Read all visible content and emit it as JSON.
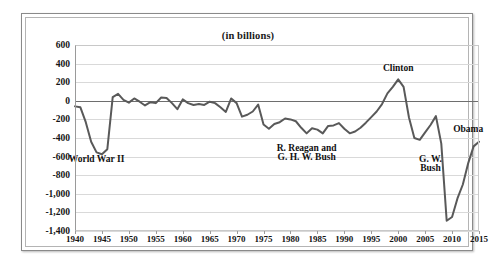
{
  "figure": {
    "title": "(in billions)"
  },
  "chart_data": {
    "type": "line",
    "title": "(in billions)",
    "subtitle": "",
    "xlabel": "",
    "ylabel": "",
    "xlim": [
      1940,
      2015
    ],
    "ylim": [
      -1400,
      600
    ],
    "grid": true,
    "legend_position": "none",
    "zero_line": 0,
    "line_color": "#595959",
    "gridline_color": "#d9d9d9",
    "y_ticks": [
      600,
      400,
      200,
      0,
      -200,
      -400,
      -600,
      -800,
      -1000,
      -1200,
      -1400
    ],
    "y_tick_labels": [
      "600",
      "400",
      "200",
      "0",
      "-200",
      "-400",
      "-600",
      "-800",
      "-1,000",
      "-1,200",
      "-1,400"
    ],
    "x_ticks": [
      1940,
      1945,
      1950,
      1955,
      1960,
      1965,
      1970,
      1975,
      1980,
      1985,
      1990,
      1995,
      2000,
      2005,
      2010,
      2015
    ],
    "x_tick_labels": [
      "1940",
      "1945",
      "1950",
      "1955",
      "1960",
      "1965",
      "1970",
      "1975",
      "1980",
      "1985",
      "1990",
      "1995",
      "2000",
      "2005",
      "2010",
      "2015"
    ],
    "series": [
      {
        "name": "Federal surplus or deficit",
        "x": [
          1940,
          1941,
          1942,
          1943,
          1944,
          1945,
          1946,
          1947,
          1948,
          1949,
          1950,
          1951,
          1952,
          1953,
          1954,
          1955,
          1956,
          1957,
          1958,
          1959,
          1960,
          1961,
          1962,
          1963,
          1964,
          1965,
          1966,
          1967,
          1968,
          1969,
          1970,
          1971,
          1972,
          1973,
          1974,
          1975,
          1976,
          1977,
          1978,
          1979,
          1980,
          1981,
          1982,
          1983,
          1984,
          1985,
          1986,
          1987,
          1988,
          1989,
          1990,
          1991,
          1992,
          1993,
          1994,
          1995,
          1996,
          1997,
          1998,
          1999,
          2000,
          2001,
          2002,
          2003,
          2004,
          2005,
          2006,
          2007,
          2008,
          2009,
          2010,
          2011,
          2012,
          2013,
          2014,
          2015
        ],
        "values": [
          -60,
          -70,
          -230,
          -440,
          -555,
          -575,
          -520,
          40,
          75,
          10,
          -20,
          25,
          -10,
          -50,
          -15,
          -25,
          35,
          30,
          -25,
          -90,
          15,
          -25,
          -45,
          -35,
          -45,
          -10,
          -25,
          -70,
          -120,
          25,
          -25,
          -170,
          -150,
          -115,
          -40,
          -255,
          -300,
          -250,
          -230,
          -190,
          -200,
          -220,
          -290,
          -350,
          -295,
          -310,
          -350,
          -270,
          -265,
          -240,
          -300,
          -350,
          -330,
          -290,
          -235,
          -175,
          -115,
          -35,
          80,
          150,
          230,
          150,
          -180,
          -400,
          -420,
          -340,
          -260,
          -165,
          -460,
          -1290,
          -1250,
          -1050,
          -900,
          -670,
          -490,
          -440
        ],
        "color": "#595959"
      }
    ],
    "annotations": [
      {
        "label": "World War II",
        "x": 1944,
        "y": -640
      },
      {
        "label": "R. Reagan and",
        "x": 1983,
        "y": -520
      },
      {
        "label": "G. H. W. Bush",
        "x": 1983,
        "y": -610
      },
      {
        "label": "Clinton",
        "x": 2000,
        "y": 345
      },
      {
        "label": "G. W.",
        "x": 2006,
        "y": -640
      },
      {
        "label": "Bush",
        "x": 2006,
        "y": -730
      },
      {
        "label": "Obama",
        "x": 2013,
        "y": -310
      }
    ]
  }
}
